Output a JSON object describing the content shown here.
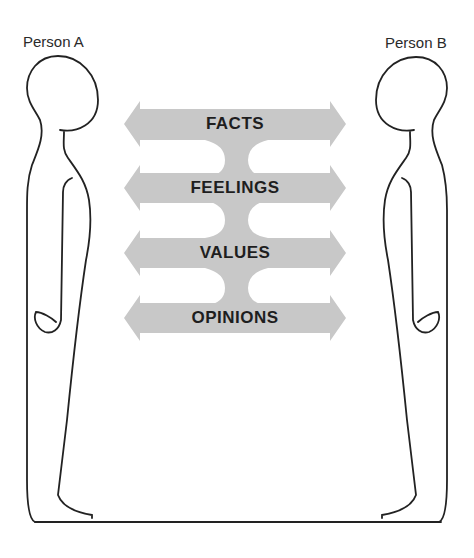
{
  "diagram": {
    "people": [
      {
        "label": "Person A",
        "side": "left"
      },
      {
        "label": "Person B",
        "side": "right"
      }
    ],
    "channels": [
      {
        "label": "FACTS"
      },
      {
        "label": "FEELINGS"
      },
      {
        "label": "VALUES"
      },
      {
        "label": "OPINIONS"
      }
    ],
    "colors": {
      "arrow_fill": "#c8c8c8",
      "outline": "#222222",
      "text": "#1e1e1e"
    }
  }
}
